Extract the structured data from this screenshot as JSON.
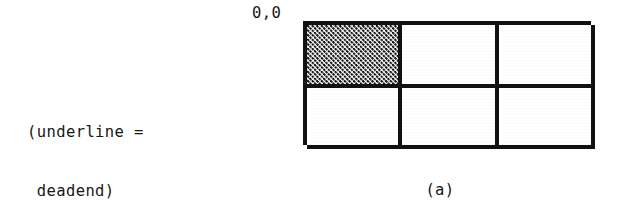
{
  "figure": {
    "caption": "(a)",
    "origin_label": "0,0",
    "legend": {
      "line1": "(underline =",
      "line2": " deadend)"
    },
    "colors": {
      "ink": "#111111",
      "paper": "#ffffff"
    }
  },
  "chart_data": {
    "type": "heatmap",
    "title": "(a)",
    "xlabel": "",
    "ylabel": "",
    "columns": 3,
    "rows": 2,
    "origin_label": "0,0",
    "origin_corner": "top-left",
    "legend_entries": [
      "(underline = deadend)"
    ],
    "cell_states": [
      [
        "shaded",
        "empty",
        "empty"
      ],
      [
        "empty",
        "empty",
        "empty"
      ]
    ],
    "values": [
      [
        1,
        0,
        0
      ],
      [
        0,
        0,
        0
      ]
    ],
    "cells": [
      {
        "row": 0,
        "col": 0,
        "coord": "0,0",
        "fill": "stipple",
        "state": "shaded"
      },
      {
        "row": 0,
        "col": 1,
        "coord": "0,1",
        "fill": "none",
        "state": "empty"
      },
      {
        "row": 0,
        "col": 2,
        "coord": "0,2",
        "fill": "none",
        "state": "empty"
      },
      {
        "row": 1,
        "col": 0,
        "coord": "1,0",
        "fill": "none",
        "state": "empty"
      },
      {
        "row": 1,
        "col": 1,
        "coord": "1,1",
        "fill": "none",
        "state": "empty"
      },
      {
        "row": 1,
        "col": 2,
        "coord": "1,2",
        "fill": "none",
        "state": "empty"
      }
    ],
    "grid": true,
    "legend_position": "left"
  }
}
